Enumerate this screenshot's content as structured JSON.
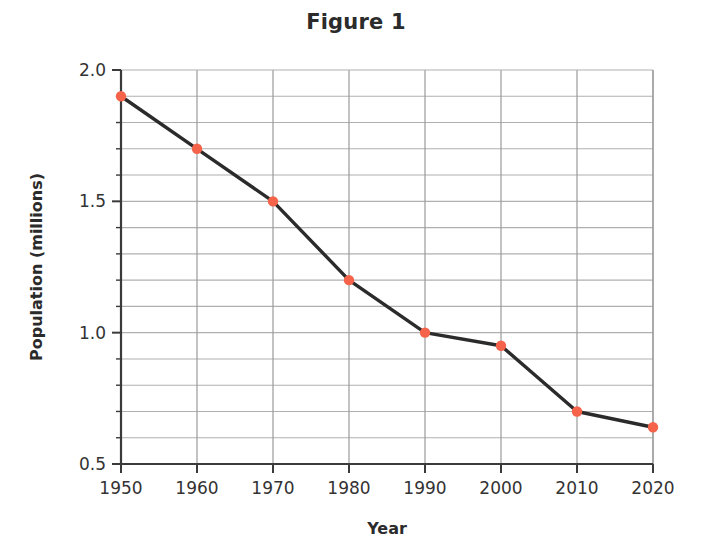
{
  "chart_data": {
    "type": "line",
    "title": "Figure 1",
    "xlabel": "Year",
    "ylabel": "Population (millions)",
    "x": [
      1950,
      1960,
      1970,
      1980,
      1990,
      2000,
      2010,
      2020
    ],
    "values": [
      1.9,
      1.7,
      1.5,
      1.2,
      1.0,
      0.95,
      0.7,
      0.64
    ],
    "series": [
      {
        "name": "Population",
        "values": [
          1.9,
          1.7,
          1.5,
          1.2,
          1.0,
          0.95,
          0.7,
          0.64
        ]
      }
    ],
    "xlim": [
      1950,
      2020
    ],
    "ylim": [
      0.5,
      2.0
    ],
    "x_tick_labels": [
      "1950",
      "1960",
      "1970",
      "1980",
      "1990",
      "2000",
      "2010",
      "2020"
    ],
    "y_tick_labels": [
      "2.0",
      "1.5",
      "1.0",
      "0.5"
    ],
    "y_major_ticks": [
      2.0,
      1.5,
      1.0,
      0.5
    ],
    "y_minor_step": 0.1,
    "grid": true,
    "legend": false,
    "line_color": "#2b2b2b",
    "marker_color": "#f4634a",
    "grid_color": "#b0b0b0",
    "axis_color": "#3a3a3a"
  },
  "figure": {
    "title": "Figure 1",
    "x_axis_label": "Year",
    "y_axis_label": "Population (millions)"
  }
}
